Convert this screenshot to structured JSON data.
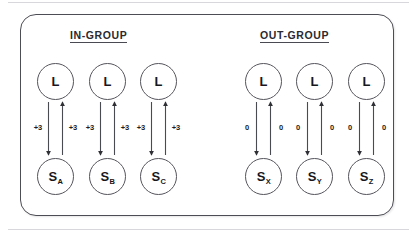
{
  "figure": {
    "frame_color": "#4d4d55",
    "node_stroke": "#55555d",
    "arrow_color": "#3a3a42",
    "groups": [
      {
        "id": "in-group",
        "heading": "IN-GROUP",
        "columns": [
          {
            "leader_label": "L",
            "subject_base": "S",
            "subject_sub": "A",
            "weight_down": "+3",
            "weight_up": "+3"
          },
          {
            "leader_label": "L",
            "subject_base": "S",
            "subject_sub": "B",
            "weight_down": "+3",
            "weight_up": "+3"
          },
          {
            "leader_label": "L",
            "subject_base": "S",
            "subject_sub": "C",
            "weight_down": "+3",
            "weight_up": "+3"
          }
        ]
      },
      {
        "id": "out-group",
        "heading": "OUT-GROUP",
        "columns": [
          {
            "leader_label": "L",
            "subject_base": "S",
            "subject_sub": "X",
            "weight_down": "0",
            "weight_up": "0"
          },
          {
            "leader_label": "L",
            "subject_base": "S",
            "subject_sub": "Y",
            "weight_down": "0",
            "weight_up": "0"
          },
          {
            "leader_label": "L",
            "subject_base": "S",
            "subject_sub": "Z",
            "weight_down": "0",
            "weight_up": "0"
          }
        ]
      }
    ]
  }
}
